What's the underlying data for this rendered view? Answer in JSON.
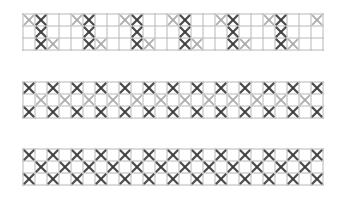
{
  "canvas": {
    "width": 341,
    "height": 200,
    "background": "#ffffff"
  },
  "style": {
    "grid_color": "#b8b8b8",
    "dark_stitch_color": "#3a3a3a",
    "light_stitch_color": "#a8a8a8",
    "cell_size": 12,
    "columns": 25,
    "rows": 3
  },
  "bands": [
    {
      "name": "band-1",
      "top": 13,
      "description": "Zig-zag pattern: full dark stitch columns with light stitches stepping between them",
      "pattern_period": [
        "L..",
        "DDD",
        "..L",
        "..."
      ],
      "legend": "each string is a column, chars are rows top-to-bottom; D=dark X, L=light X, .=empty"
    },
    {
      "name": "band-2",
      "top": 81,
      "description": "Checker pattern: dark stitches on top and bottom rows, light stitches in middle row offset",
      "pattern_period": [
        "D.D",
        ".L."
      ],
      "legend": "each string is a column, chars are rows top-to-bottom"
    },
    {
      "name": "band-3",
      "top": 148,
      "description": "Checker pattern: all stitches dark, top/bottom alternate with middle",
      "pattern_period": [
        "D.D",
        ".D."
      ],
      "legend": "each string is a column, chars are rows top-to-bottom"
    }
  ]
}
